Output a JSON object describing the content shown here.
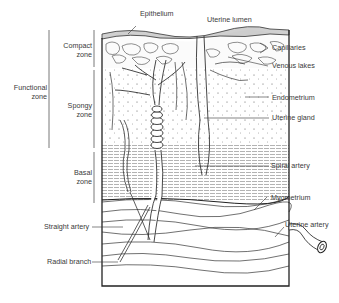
{
  "diagram": {
    "labels": {
      "epithelium": "Epithelium",
      "uterine_lumen": "Uterine lumen",
      "compact_zone_1": "Compact",
      "compact_zone_2": "zone",
      "functional_zone_1": "Functional",
      "functional_zone_2": "zone",
      "spongy_zone_1": "Spongy",
      "spongy_zone_2": "zone",
      "basal_zone_1": "Basal",
      "basal_zone_2": "zone",
      "capillaries": "Capillaries",
      "venous_lakes": "Venous lakes",
      "endometrium": "Endometrium",
      "uterine_gland": "Uterine gland",
      "spiral_artery": "Spiral artery",
      "myometrium": "Myometrium",
      "uterine_artery": "Uterine artery",
      "straight_artery": "Straight artery",
      "radial_branch": "Radial branch"
    },
    "colors": {
      "ink": "#2a2a2a",
      "label": "#3a3a3a",
      "background": "#ffffff"
    }
  }
}
